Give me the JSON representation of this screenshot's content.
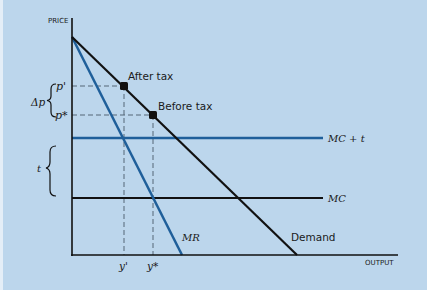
{
  "diagram": {
    "axes": {
      "y_label": "PRICE",
      "x_label": "OUTPUT"
    },
    "curves": {
      "demand": "Demand",
      "mr": "MR",
      "mc": "MC",
      "mc_t": "MC + t"
    },
    "points": {
      "after_tax": "After tax",
      "before_tax": "Before tax"
    },
    "price_labels": {
      "p_prime": "p'",
      "p_star": "p*",
      "delta_p": "Δp"
    },
    "quantity_labels": {
      "y_prime": "y'",
      "y_star": "y*"
    },
    "tax_label": "t",
    "colors": {
      "background": "#bcd6ec",
      "black_curves": "#111111",
      "blue_curves": "#1f5f9a",
      "dashed": "#556677"
    }
  }
}
